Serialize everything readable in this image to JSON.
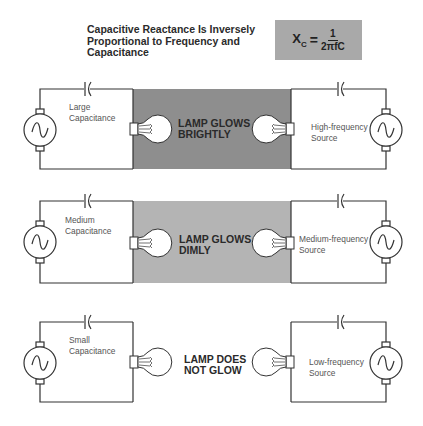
{
  "header": {
    "title_lines": [
      "Capacitive Reactance Is Inversely",
      "Proportional to Frequency and",
      "Capacitance"
    ],
    "formula": {
      "lhs": "X",
      "lhs_sub": "C",
      "equals": "=",
      "numerator": "1",
      "denominator": "2πfC"
    }
  },
  "colors": {
    "formula_box": "#a9a9a9",
    "shade_bright": "#8e8e8e",
    "shade_dim": "#b4b4b4",
    "wire": "#333333",
    "background": "#ffffff"
  },
  "rows": [
    {
      "capacitance_label_lines": [
        "Large",
        "Capacitance"
      ],
      "source_label_lines": [
        "High-frequency",
        "Source"
      ],
      "lamp_status_lines": [
        "LAMP GLOWS",
        "BRIGHTLY"
      ],
      "shade": "bright"
    },
    {
      "capacitance_label_lines": [
        "Medium",
        "Capacitance"
      ],
      "source_label_lines": [
        "Medium-frequency",
        "Source"
      ],
      "lamp_status_lines": [
        "LAMP GLOWS",
        "DIMLY"
      ],
      "shade": "dim"
    },
    {
      "capacitance_label_lines": [
        "Small",
        "Capacitance"
      ],
      "source_label_lines": [
        "Low-frequency",
        "Source"
      ],
      "lamp_status_lines": [
        "LAMP DOES",
        "NOT GLOW"
      ],
      "shade": "none"
    }
  ],
  "icons": {
    "generator": "ac-generator-icon",
    "capacitor": "capacitor-icon",
    "lamp": "light-bulb-icon"
  }
}
